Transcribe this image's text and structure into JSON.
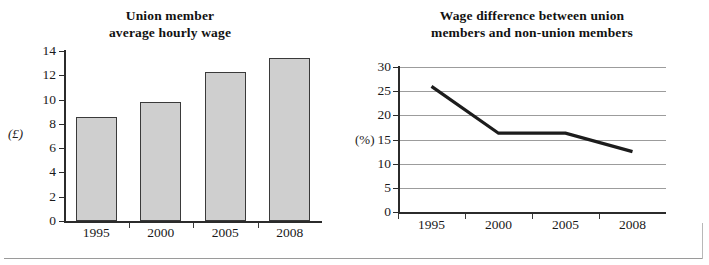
{
  "figures": [
    {
      "id": "union-wage-bar-chart",
      "title_lines": [
        "Union member",
        "average hourly wage"
      ],
      "y_axis_label": "(£)"
    },
    {
      "id": "wage-difference-line-chart",
      "title_lines": [
        "Wage difference between union",
        "members and non-union members"
      ],
      "y_axis_label": "(%)"
    }
  ],
  "chart_data": [
    {
      "type": "bar",
      "title": "Union member average hourly wage",
      "categories": [
        "1995",
        "2000",
        "2005",
        "2008"
      ],
      "values": [
        8.6,
        9.8,
        12.3,
        13.4
      ],
      "xlabel": "",
      "ylabel": "(£)",
      "ylim": [
        0,
        14
      ],
      "yticks": [
        0,
        2,
        4,
        6,
        8,
        10,
        12,
        14
      ],
      "ytick_labels": [
        "0",
        "2",
        "4",
        "6",
        "8",
        "10",
        "12",
        "14"
      ],
      "grid": false,
      "bar_fill": "#cfcfcf",
      "bar_edge": "#3a3a3a"
    },
    {
      "type": "line",
      "title": "Wage difference between union members and non-union members",
      "x": [
        "1995",
        "2000",
        "2005",
        "2008"
      ],
      "values": [
        26.0,
        16.3,
        16.3,
        12.5
      ],
      "xlabel": "",
      "ylabel": "(%)",
      "ylim": [
        0,
        30
      ],
      "yticks": [
        0,
        5,
        10,
        15,
        20,
        25,
        30
      ],
      "ytick_labels": [
        "0",
        "5",
        "10",
        "15",
        "20",
        "25",
        "30"
      ],
      "grid": true,
      "grid_color": "#9c9c9c",
      "line_color": "#1c1c1c"
    }
  ]
}
